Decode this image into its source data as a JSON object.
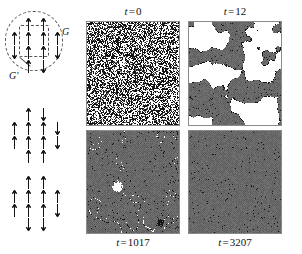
{
  "figure": {
    "background": "#ffffff",
    "width": 302,
    "height": 254
  },
  "schematic": {
    "name": "block-spin-renormalization-schematic",
    "labels": {
      "group_outer": "G",
      "group_inner": "G'"
    },
    "groups": [
      {
        "id": "top",
        "has_dashed_outline": true,
        "rows": [
          {
            "y": 18,
            "arrows": [
              {
                "x": 26,
                "dir": "up"
              },
              {
                "x": 41,
                "dir": "up"
              }
            ]
          },
          {
            "y": 32,
            "arrows": [
              {
                "x": 12,
                "dir": "up"
              },
              {
                "x": 26,
                "dir": "up"
              },
              {
                "x": 41,
                "dir": "up"
              },
              {
                "x": 55,
                "dir": "up"
              }
            ]
          },
          {
            "y": 46,
            "arrows": [
              {
                "x": 12,
                "dir": "down"
              },
              {
                "x": 26,
                "dir": "up"
              },
              {
                "x": 41,
                "dir": "up"
              },
              {
                "x": 55,
                "dir": "down"
              }
            ]
          },
          {
            "y": 60,
            "arrows": [
              {
                "x": 26,
                "dir": "up"
              },
              {
                "x": 41,
                "dir": "down"
              }
            ]
          }
        ]
      },
      {
        "id": "middle",
        "has_dashed_outline": false,
        "rows": [
          {
            "y": 108,
            "arrows": [
              {
                "x": 26,
                "dir": "up"
              },
              {
                "x": 41,
                "dir": "down"
              }
            ]
          },
          {
            "y": 122,
            "arrows": [
              {
                "x": 12,
                "dir": "up"
              },
              {
                "x": 26,
                "dir": "up"
              },
              {
                "x": 41,
                "dir": "up"
              },
              {
                "x": 55,
                "dir": "down"
              }
            ]
          },
          {
            "y": 136,
            "arrows": [
              {
                "x": 12,
                "dir": "up"
              },
              {
                "x": 26,
                "dir": "up"
              },
              {
                "x": 41,
                "dir": "up"
              },
              {
                "x": 55,
                "dir": "down"
              }
            ]
          },
          {
            "y": 150,
            "arrows": [
              {
                "x": 26,
                "dir": "up"
              },
              {
                "x": 41,
                "dir": "up"
              }
            ]
          }
        ]
      },
      {
        "id": "bottom",
        "has_dashed_outline": false,
        "rows": [
          {
            "y": 176,
            "arrows": [
              {
                "x": 26,
                "dir": "up"
              },
              {
                "x": 41,
                "dir": "up"
              }
            ]
          },
          {
            "y": 190,
            "arrows": [
              {
                "x": 12,
                "dir": "up"
              },
              {
                "x": 26,
                "dir": "up"
              },
              {
                "x": 41,
                "dir": "up"
              },
              {
                "x": 55,
                "dir": "up"
              }
            ]
          },
          {
            "y": 204,
            "arrows": [
              {
                "x": 12,
                "dir": "up"
              },
              {
                "x": 26,
                "dir": "up"
              },
              {
                "x": 41,
                "dir": "up"
              },
              {
                "x": 55,
                "dir": "down"
              }
            ]
          },
          {
            "y": 218,
            "arrows": [
              {
                "x": 26,
                "dir": "down"
              },
              {
                "x": 41,
                "dir": "down"
              }
            ]
          }
        ]
      }
    ]
  },
  "panels": [
    {
      "id": "t0",
      "name": "simulation-panel-t0",
      "caption": "t = 0",
      "caption_var": "t",
      "caption_eq": "=",
      "caption_value": "0",
      "caption_position": "above",
      "state": "random",
      "white_fraction": 0.5,
      "seed": 11,
      "description": "fully disordered salt-and-pepper initial condition"
    },
    {
      "id": "t12",
      "name": "simulation-panel-t12",
      "caption": "t = 12",
      "caption_var": "t",
      "caption_eq": "=",
      "caption_value": "12",
      "caption_position": "above",
      "state": "coarsening-early",
      "white_fraction": 0.3,
      "seed": 23,
      "description": "large interpenetrating white and gray domains"
    },
    {
      "id": "t1017",
      "name": "simulation-panel-t1017",
      "caption": "t = 1017",
      "caption_var": "t",
      "caption_eq": "=",
      "caption_value": "1017",
      "caption_position": "below",
      "state": "coarsening-late",
      "white_fraction": 0.02,
      "seed": 47,
      "description": "nearly uniform gray with thin residual domain walls and one small white droplet"
    },
    {
      "id": "t3207",
      "name": "simulation-panel-t3207",
      "caption": "t = 3207",
      "caption_var": "t",
      "caption_eq": "=",
      "caption_value": "3207",
      "caption_position": "below",
      "state": "ordered",
      "white_fraction": 0.0,
      "seed": 83,
      "description": "fully ordered uniform gray state"
    }
  ],
  "colors": {
    "panel_gray": "#6e6e6e",
    "panel_gray_dark": "#5a5a5a",
    "panel_white": "#ffffff",
    "panel_black": "#141414",
    "border": "#8a8a8a",
    "text": "#141414",
    "dashed": "#555555"
  }
}
